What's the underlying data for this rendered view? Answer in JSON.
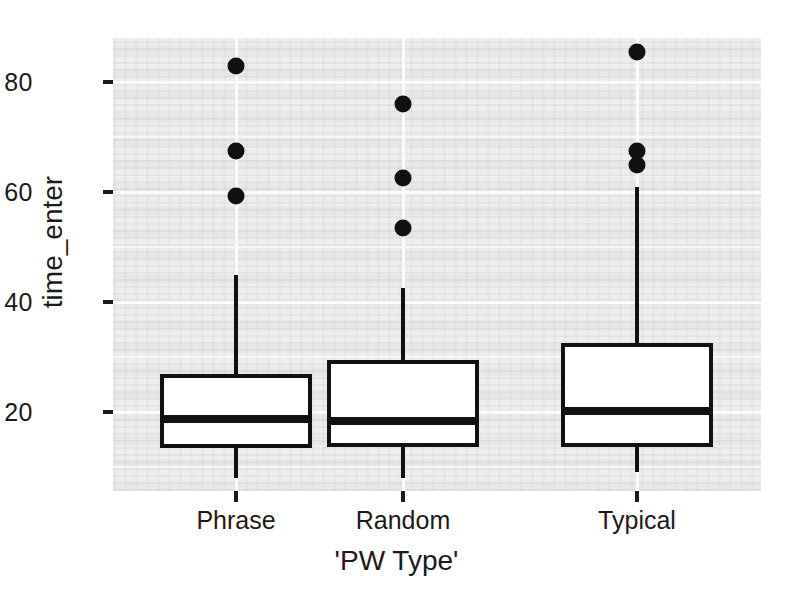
{
  "chart_data": {
    "type": "box",
    "title": "",
    "xlabel": "'PW Type'",
    "ylabel": "time_enter",
    "categories": [
      "Phrase",
      "Random",
      "Typical"
    ],
    "y_ticks": [
      20,
      40,
      60,
      80
    ],
    "ylim": [
      5,
      88
    ],
    "grid": true,
    "legend": "none",
    "series": [
      {
        "name": "Phrase",
        "min_whisker": 8.0,
        "q1": 13.5,
        "median": 18.7,
        "q3": 27.0,
        "max_whisker": 45.0,
        "outliers": [
          83.0,
          67.5,
          59.3
        ]
      },
      {
        "name": "Random",
        "min_whisker": 8.0,
        "q1": 13.7,
        "median": 18.3,
        "q3": 29.5,
        "max_whisker": 42.5,
        "outliers": [
          76.0,
          62.5,
          53.5
        ]
      },
      {
        "name": "Typical",
        "min_whisker": 9.0,
        "q1": 13.7,
        "median": 20.2,
        "q3": 32.5,
        "max_whisker": 61.0,
        "outliers": [
          85.5,
          67.5,
          65.0
        ]
      }
    ]
  },
  "axis": {
    "y_tick_labels": [
      "80",
      "60",
      "40",
      "20"
    ],
    "y_title": "time_enter",
    "x_tick_labels": [
      "Phrase",
      "Random",
      "Typical"
    ],
    "x_title": "'PW Type'"
  },
  "style": {
    "panel_background": "#eeeeee",
    "grid_color": "#fbfbfb",
    "ink_color": "#111111",
    "box_fill": "#ffffff",
    "page_background": "#ffffff"
  }
}
